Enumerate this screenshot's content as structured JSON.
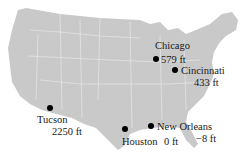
{
  "map": {
    "region": "Continental United States",
    "land_color": "#c9c9c9",
    "border_color": "#e6e6e6",
    "marker_color": "#000000"
  },
  "cities": [
    {
      "name": "Chicago",
      "elevation": "579 ft"
    },
    {
      "name": "Cincinnati",
      "elevation": "433 ft"
    },
    {
      "name": "Tucson",
      "elevation": "2250 ft"
    },
    {
      "name": "Houston",
      "elevation": "0 ft"
    },
    {
      "name": "New Orleans",
      "elevation": "−8 ft"
    }
  ]
}
